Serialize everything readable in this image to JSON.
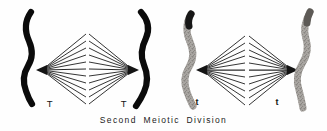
{
  "figure": {
    "caption": "Second  Meiotic  Division",
    "background_color": "#fefefe",
    "width": 327,
    "height": 131
  },
  "diagram_data": {
    "type": "scientific-illustration",
    "subject": "Second Meiotic Division",
    "description": "Four anaphase/telophase chromosome figures, each with a fan of spindle fibers converging on a kinetochore point; two solid black drawings at left and two stippled/gray photographic tracings at right.",
    "cells": [
      {
        "id": "cell-1",
        "label": "T",
        "chromosome_style": "solid-black",
        "spindle_apex_side": "right",
        "fiber_count": 11
      },
      {
        "id": "cell-2",
        "label": "T",
        "chromosome_style": "solid-black",
        "spindle_apex_side": "left",
        "fiber_count": 11
      },
      {
        "id": "cell-3",
        "label": "t",
        "chromosome_style": "stippled-gray",
        "spindle_apex_side": "right",
        "fiber_count": 11
      },
      {
        "id": "cell-4",
        "label": "t",
        "chromosome_style": "stippled-gray",
        "spindle_apex_side": "left",
        "fiber_count": 11
      }
    ],
    "colors": {
      "chromosome_dark": "#0b0b0b",
      "chromosome_gray_fill": "#c9c6c2",
      "chromosome_gray_outline": "#3a3a3a",
      "spindle_fiber": "#2a2a2a",
      "caption_text": "#1b1b1b"
    }
  },
  "labels": {
    "cell_1": "T",
    "cell_2": "T",
    "cell_3": "t",
    "cell_4": "t"
  }
}
